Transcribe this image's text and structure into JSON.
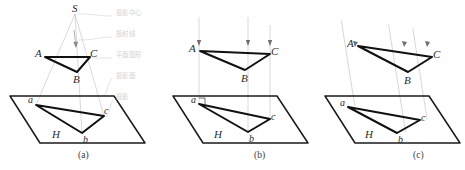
{
  "figure": {
    "title_captions": [
      {
        "id": "a",
        "label": "(a)",
        "x": 83,
        "y": 152
      },
      {
        "id": "b",
        "label": "(b)",
        "x": 259,
        "y": 152
      },
      {
        "id": "c",
        "label": "(c)",
        "x": 418,
        "y": 152
      }
    ],
    "annotations": [
      {
        "key": "projection_center",
        "label": "投影中心",
        "x": 116,
        "y": 15
      },
      {
        "key": "projection_ray",
        "label": "投射线",
        "x": 116,
        "y": 36
      },
      {
        "key": "plane_figure",
        "label": "平面图形",
        "x": 116,
        "y": 57
      },
      {
        "key": "projection_plane",
        "label": "投影面",
        "x": 116,
        "y": 78
      },
      {
        "key": "projection",
        "label": "投影",
        "x": 116,
        "y": 99
      }
    ],
    "panels": [
      {
        "id": "a",
        "type": "central-projection",
        "apex": {
          "label": "S",
          "x": 75,
          "y": 12
        },
        "space_triangle": {
          "vertices": [
            {
              "label": "A",
              "x": 45,
              "y": 57
            },
            {
              "label": "C",
              "x": 90,
              "y": 57
            },
            {
              "label": "B",
              "x": 77,
              "y": 72
            }
          ]
        },
        "projected_triangle": {
          "vertices": [
            {
              "label": "a",
              "x": 36,
              "y": 105
            },
            {
              "label": "c",
              "x": 104,
              "y": 116
            },
            {
              "label": "b",
              "x": 82,
              "y": 133
            }
          ]
        },
        "plane": {
          "label": "H",
          "label_x": 57,
          "label_y": 135
        },
        "ray_style": "converging"
      },
      {
        "id": "b",
        "type": "orthographic-projection",
        "space_triangle": {
          "vertices": [
            {
              "label": "A",
              "x": 200,
              "y": 51
            },
            {
              "label": "C",
              "x": 270,
              "y": 54
            },
            {
              "label": "B",
              "x": 245,
              "y": 70
            }
          ]
        },
        "projected_triangle": {
          "vertices": [
            {
              "label": "a",
              "x": 199,
              "y": 104
            },
            {
              "label": "c",
              "x": 270,
              "y": 119
            },
            {
              "label": "b",
              "x": 248,
              "y": 132
            }
          ]
        },
        "plane": {
          "label": "H",
          "label_x": 218,
          "label_y": 136
        },
        "ray_style": "vertical-parallel",
        "right_angle_mark": true
      },
      {
        "id": "c",
        "type": "oblique-projection",
        "space_triangle": {
          "vertices": [
            {
              "label": "A",
              "x": 358,
              "y": 46
            },
            {
              "label": "C",
              "x": 432,
              "y": 57
            },
            {
              "label": "B",
              "x": 408,
              "y": 72
            }
          ]
        },
        "projected_triangle": {
          "vertices": [
            {
              "label": "a",
              "x": 348,
              "y": 107
            },
            {
              "label": "c",
              "x": 420,
              "y": 120
            },
            {
              "label": "b",
              "x": 397,
              "y": 133
            }
          ]
        },
        "plane": {
          "label": "H",
          "label_x": 369,
          "label_y": 136
        },
        "ray_style": "oblique-parallel"
      }
    ],
    "colors": {
      "stroke_dark": "#1a1a1a",
      "stroke_ray": "#c9c9c9",
      "annotation_text": "#d2d2d2",
      "label_text": "#2b2b2b",
      "background": "#ffffff"
    }
  }
}
